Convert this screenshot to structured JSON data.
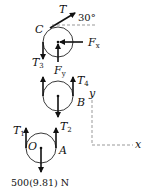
{
  "figure": {
    "type": "free-body diagram of pulley system",
    "pulleys": [
      {
        "id": "C",
        "label": "C"
      },
      {
        "id": "B",
        "label": "B"
      },
      {
        "id": "O",
        "label": "O"
      }
    ],
    "point_labels": {
      "A": "A"
    },
    "forces": {
      "T": {
        "symbol": "T",
        "subscript": ""
      },
      "Fx": {
        "symbol": "F",
        "subscript": "x"
      },
      "Fy": {
        "symbol": "F",
        "subscript": "y"
      },
      "T1": {
        "symbol": "T",
        "subscript": "1"
      },
      "T2": {
        "symbol": "T",
        "subscript": "2"
      },
      "T3": {
        "symbol": "T",
        "subscript": "3"
      },
      "T4": {
        "symbol": "T",
        "subscript": "4"
      }
    },
    "angle_label": "30°",
    "load_label": "500(9.81) N",
    "axes": {
      "x_label": "x",
      "y_label": "y"
    }
  }
}
